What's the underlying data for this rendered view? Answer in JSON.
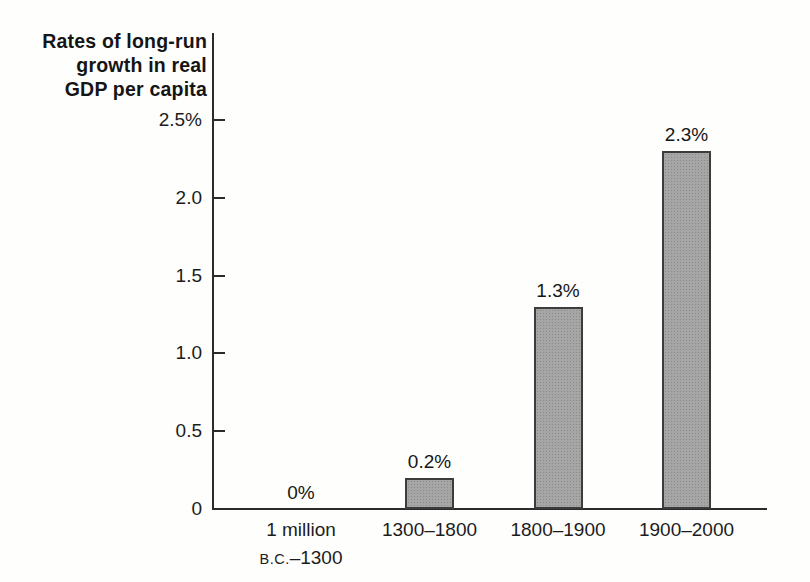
{
  "figure": {
    "background": "#fefefd",
    "kind": "scanned textbook bar chart"
  },
  "chart_data": {
    "type": "bar",
    "title": "Rates of long-run growth in real GDP per capita",
    "title_lines": [
      "Rates of long-run",
      "growth in real",
      "GDP per capita"
    ],
    "xlabel": "",
    "ylabel": "Rates of long-run growth in real GDP per capita",
    "categories": [
      "1 million B.C.–1300",
      "1300–1800",
      "1800–1900",
      "1900–2000"
    ],
    "category_lines": [
      [
        "1 million",
        "B.C.–1300"
      ],
      [
        "1300–1800"
      ],
      [
        "1800–1900"
      ],
      [
        "1900–2000"
      ]
    ],
    "values": [
      0,
      0.2,
      1.3,
      2.3
    ],
    "value_labels": [
      "0%",
      "0.2%",
      "1.3%",
      "2.3%"
    ],
    "ylim": [
      0,
      2.5
    ],
    "y_ticks": [
      {
        "value": 0,
        "label": "0"
      },
      {
        "value": 0.5,
        "label": "0.5"
      },
      {
        "value": 1.0,
        "label": "1.0"
      },
      {
        "value": 1.5,
        "label": "1.5"
      },
      {
        "value": 2.0,
        "label": "2.0"
      },
      {
        "value": 2.5,
        "label": "2.5%"
      }
    ],
    "grid": false,
    "legend": null,
    "colors": {
      "bar_fill": "#a6a6a6",
      "bar_border": "#3c3c3c",
      "axis": "#2b2b2b",
      "text": "#1a1a1a",
      "background": "#fefefd"
    }
  }
}
